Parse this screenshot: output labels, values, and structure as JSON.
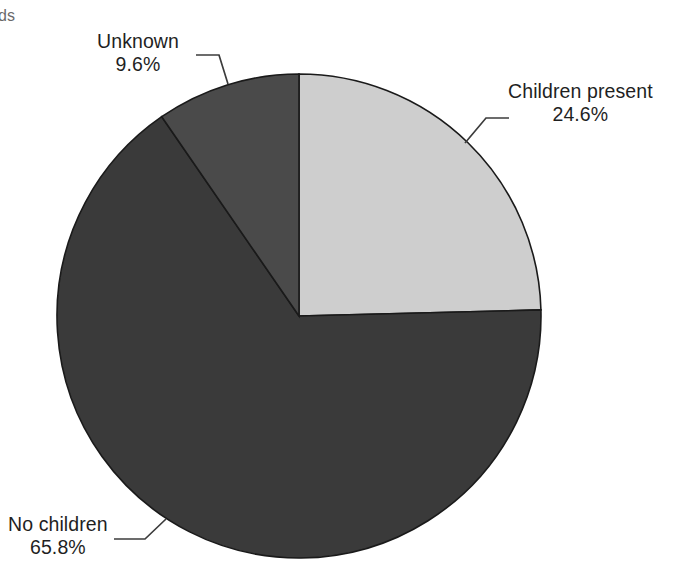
{
  "page": {
    "background_color": "#ffffff",
    "cut_off_title_fragment": "ds"
  },
  "chart_data": {
    "type": "pie",
    "title": "",
    "subtitle": "",
    "xlabel": "",
    "ylabel": "",
    "legend_position": "none",
    "grid": false,
    "labels_inside": false,
    "start_angle_deg": 0,
    "direction": "clockwise",
    "center": {
      "x": 299,
      "y": 316
    },
    "radius": 242,
    "categories": [
      "Children present",
      "No children",
      "Unknown"
    ],
    "values": [
      24.6,
      65.8,
      9.6
    ],
    "value_unit": "%",
    "slices": [
      {
        "label": "Children present",
        "value": 24.6,
        "value_text": "24.6%",
        "color": "#cecece",
        "start_angle_deg": 0,
        "end_angle_deg": 88.56,
        "leader": {
          "arc_x": 465,
          "arc_y": 143,
          "elbow_x": 486,
          "elbow_y": 118,
          "end_x": 509,
          "end_y": 118
        }
      },
      {
        "label": "No children",
        "value": 65.8,
        "value_text": "65.8%",
        "color": "#3a3a3a",
        "start_angle_deg": 88.56,
        "end_angle_deg": 325.44,
        "leader": {
          "arc_x": 166,
          "arc_y": 519,
          "elbow_x": 145,
          "elbow_y": 539,
          "end_x": 114,
          "end_y": 539
        }
      },
      {
        "label": "Unknown",
        "value": 9.6,
        "value_text": "9.6%",
        "color": "#4a4a4a",
        "start_angle_deg": 325.44,
        "end_angle_deg": 360,
        "leader": {
          "arc_x": 228,
          "arc_y": 84,
          "elbow_x": 219,
          "elbow_y": 55,
          "end_x": 196,
          "end_y": 55
        }
      }
    ],
    "outline_color": "#1a1a1a",
    "leader_line_color": "#3c3c3c"
  }
}
